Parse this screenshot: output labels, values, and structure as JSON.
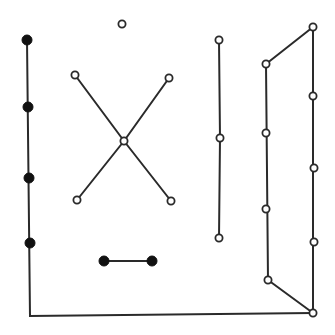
{
  "figure": {
    "width": 335,
    "height": 335,
    "colors": {
      "edge": "#2a2a2a",
      "filled_vertex": "#111111",
      "open_vertex_fill": "#ffffff"
    },
    "components": [
      {
        "name": "left-path-to-bottom-right",
        "vertices": [
          {
            "x": 27,
            "y": 40,
            "type": "filled"
          },
          {
            "x": 28,
            "y": 107,
            "type": "filled"
          },
          {
            "x": 29,
            "y": 178,
            "type": "filled"
          },
          {
            "x": 30,
            "y": 243,
            "type": "filled"
          }
        ],
        "polyline": [
          [
            27,
            40
          ],
          [
            30,
            316
          ],
          [
            313,
            313
          ]
        ]
      },
      {
        "name": "isolated-vertex",
        "vertices": [
          {
            "x": 122,
            "y": 24,
            "type": "open"
          }
        ],
        "edges": []
      },
      {
        "name": "star-x",
        "vertices": [
          {
            "x": 75,
            "y": 75,
            "type": "open"
          },
          {
            "x": 169,
            "y": 78,
            "type": "open"
          },
          {
            "x": 124,
            "y": 141,
            "type": "open"
          },
          {
            "x": 77,
            "y": 200,
            "type": "open"
          },
          {
            "x": 171,
            "y": 201,
            "type": "open"
          }
        ],
        "edges": [
          [
            75,
            75,
            124,
            141
          ],
          [
            169,
            78,
            124,
            141
          ],
          [
            124,
            141,
            77,
            200
          ],
          [
            124,
            141,
            171,
            201
          ]
        ]
      },
      {
        "name": "vertical-path",
        "vertices": [
          {
            "x": 219,
            "y": 40,
            "type": "open"
          },
          {
            "x": 220,
            "y": 138,
            "type": "open"
          },
          {
            "x": 219,
            "y": 238,
            "type": "open"
          }
        ],
        "edges": [
          [
            219,
            40,
            220,
            138
          ],
          [
            220,
            138,
            219,
            238
          ]
        ]
      },
      {
        "name": "right-cycle",
        "vertices": [
          {
            "x": 266,
            "y": 64,
            "type": "open"
          },
          {
            "x": 266,
            "y": 133,
            "type": "open"
          },
          {
            "x": 266,
            "y": 209,
            "type": "open"
          },
          {
            "x": 268,
            "y": 280,
            "type": "open"
          },
          {
            "x": 313,
            "y": 27,
            "type": "open"
          },
          {
            "x": 313,
            "y": 96,
            "type": "open"
          },
          {
            "x": 314,
            "y": 168,
            "type": "open"
          },
          {
            "x": 314,
            "y": 242,
            "type": "open"
          },
          {
            "x": 313,
            "y": 313,
            "type": "open"
          }
        ],
        "edges": [
          [
            266,
            64,
            313,
            27
          ],
          [
            266,
            64,
            268,
            280
          ],
          [
            268,
            280,
            313,
            313
          ],
          [
            313,
            27,
            313,
            313
          ]
        ]
      },
      {
        "name": "filled-pair",
        "vertices": [
          {
            "x": 104,
            "y": 261,
            "type": "filled"
          },
          {
            "x": 152,
            "y": 261,
            "type": "filled"
          }
        ],
        "edges": [
          [
            104,
            261,
            152,
            261
          ]
        ]
      }
    ]
  }
}
